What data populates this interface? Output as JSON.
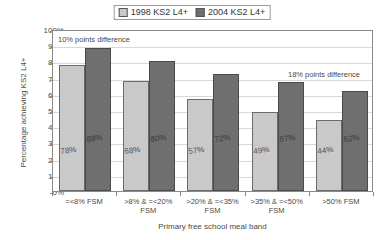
{
  "chart_data": {
    "type": "bar",
    "title": "",
    "xlabel": "Primary free school meal band",
    "ylabel": "Percentage achieving KS2 L4+",
    "ylim": [
      0,
      100
    ],
    "ytick_labels": [
      "100%",
      "90%",
      "80%",
      "70%",
      "60%",
      "50%",
      "40%",
      "30%",
      "20%",
      "10%",
      "0%"
    ],
    "ytick_values": [
      100,
      90,
      80,
      70,
      60,
      50,
      40,
      30,
      20,
      10,
      0
    ],
    "grid": true,
    "legend_position": "top-center",
    "categories": [
      "=<8% FSM",
      ">8% & =<20% FSM",
      ">20% & =<35% FSM",
      ">35% & =<50% FSM",
      ">50% FSM"
    ],
    "series": [
      {
        "name": "1998 KS2 L4+",
        "color": "#c9c9c9",
        "values": [
          78,
          68,
          57,
          49,
          44
        ],
        "value_labels": [
          "78%",
          "68%",
          "57%",
          "49%",
          "44%"
        ]
      },
      {
        "name": "2004 KS2 L4+",
        "color": "#6f6f6f",
        "values": [
          88,
          80,
          72,
          67,
          62
        ],
        "value_labels": [
          "88%",
          "80%",
          "72%",
          "67%",
          "62%"
        ]
      }
    ],
    "annotations": [
      {
        "text": "10% points difference",
        "position": "top-left"
      },
      {
        "text": "18% points difference",
        "position": "middle-right"
      }
    ]
  },
  "legend": {
    "entries": [
      {
        "label": "1998 KS2 L4+"
      },
      {
        "label": "2004 KS2 L4+"
      }
    ]
  }
}
